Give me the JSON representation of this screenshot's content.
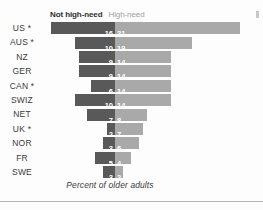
{
  "legend": {
    "not_high_need": "Not high-need",
    "high_need": "High-need"
  },
  "caption": "Percent of older adults",
  "colors": {
    "not_high_need": "#595959",
    "high_need": "#a9a9a9",
    "background": "#fdfdfd",
    "text": "#3b3b3b",
    "rule": "#b4b4b4"
  },
  "chart_data": {
    "type": "bar",
    "title": "",
    "subtitle": "",
    "xlabel": "Percent of older adults",
    "ylabel": "",
    "orientation": "horizontal",
    "stacked": true,
    "centered_on_divider": true,
    "grid": false,
    "legend_position": "top",
    "categories": [
      "US *",
      "AUS *",
      "NZ",
      "GER",
      "CAN *",
      "SWIZ",
      "NET",
      "UK *",
      "NOR",
      "FR",
      "SWE"
    ],
    "series": [
      {
        "name": "Not high-need",
        "color": "#595959",
        "values": [
          16,
          10,
          9,
          9,
          6,
          10,
          7,
          2,
          3,
          5,
          3
        ]
      },
      {
        "name": "High-need",
        "color": "#a9a9a9",
        "values": [
          31,
          19,
          14,
          14,
          14,
          14,
          8,
          7,
          6,
          4,
          2
        ]
      }
    ],
    "units": "percent",
    "footnote_marker": "*"
  },
  "layout": {
    "px_per_unit": 4.03,
    "divider_x": 115,
    "row_height": 14.4,
    "bar_height": 12,
    "plot_top": 21,
    "label_width": 44
  }
}
